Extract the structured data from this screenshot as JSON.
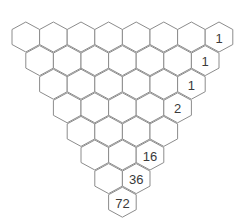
{
  "puzzle": {
    "type": "inverted-triangle-hex-grid",
    "rows": 8,
    "geometry": {
      "origin_x": 12,
      "origin_y": 37,
      "hex_width": 27.6,
      "row_step": 23.6,
      "hex_height": 30
    },
    "colors": {
      "background": "#ffffff",
      "stroke": "#8c8c8c",
      "text": "#3a3a3a"
    },
    "cells": [
      [
        "",
        "",
        "",
        "",
        "",
        "",
        "",
        "1"
      ],
      [
        "",
        "",
        "",
        "",
        "",
        "",
        "1"
      ],
      [
        "",
        "",
        "",
        "",
        "",
        "1"
      ],
      [
        "",
        "",
        "",
        "",
        "2"
      ],
      [
        "",
        "",
        "",
        ""
      ],
      [
        "",
        "",
        "16"
      ],
      [
        "",
        "36"
      ],
      [
        "72"
      ]
    ]
  }
}
